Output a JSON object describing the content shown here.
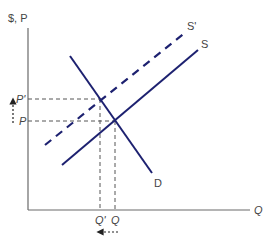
{
  "diagram": {
    "type": "supply-demand-shift",
    "colors": {
      "curve": "#1d2170",
      "axis": "#6a6a6a",
      "guide": "#555555"
    },
    "axes": {
      "y_label": "$, P",
      "x_label": "Q"
    },
    "curves": {
      "supply": {
        "label": "S"
      },
      "supply_shifted": {
        "label": "S'"
      },
      "demand": {
        "label": "D"
      }
    },
    "price_labels": {
      "new": "P'",
      "original": "P"
    },
    "quantity_labels": {
      "new": "Q'",
      "original": "Q"
    },
    "annotations": {
      "price_change": "price rises from P to P'",
      "quantity_change": "quantity falls from Q to Q'"
    }
  }
}
